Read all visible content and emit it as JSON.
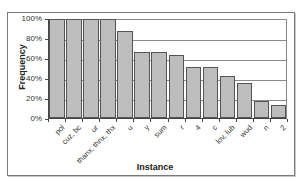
{
  "chart_data": {
    "type": "bar",
    "title": "",
    "xlabel": "Instance",
    "ylabel": "Frequency",
    "ylim": [
      0,
      100
    ],
    "yticks": [
      "0%",
      "20%",
      "40%",
      "60%",
      "80%",
      "100%"
    ],
    "grid": true,
    "legend": null,
    "categories": [
      "pol",
      "cuz, bc",
      "ur",
      "thanx, thnx, thx",
      "u",
      "y",
      "sum",
      "r",
      "4",
      "c",
      "lov, lub",
      "wud",
      "n",
      "2"
    ],
    "values": [
      100,
      100,
      100,
      100,
      88,
      67,
      67,
      64,
      52,
      52,
      42,
      35,
      17,
      13
    ],
    "colors": {
      "bar_fill": "#bdbdbd",
      "bar_edge": "#555555",
      "grid": "#8a8a8a"
    }
  }
}
